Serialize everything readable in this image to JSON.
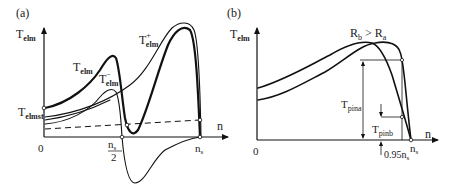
{
  "panel_a": {
    "tag": "(a)",
    "y_axis_label": {
      "main": "T",
      "sub": "elm"
    },
    "x_axis_label": "n",
    "origin_label": "0",
    "start_torque_label": {
      "main": "T",
      "sub": "elmst"
    },
    "half_sync_label": {
      "num_main": "n",
      "num_sub": "s",
      "den": "2"
    },
    "sync_label": {
      "main": "n",
      "sub": "s"
    },
    "curve_labels": {
      "total": {
        "main": "T",
        "sub": "elm"
      },
      "positive": {
        "main": "T",
        "sub": "elm",
        "sup": "+"
      },
      "negative": {
        "main": "T",
        "sub": "elm",
        "sup": "−"
      }
    }
  },
  "panel_b": {
    "tag": "(b)",
    "y_axis_label": {
      "main": "T",
      "sub": "elm"
    },
    "x_axis_label": "n",
    "origin_label": "0",
    "relation_label": {
      "a": "R",
      "a_sub": "b",
      "op": " > ",
      "b": "R",
      "b_sub": "a"
    },
    "pina_label": {
      "main": "T",
      "sub": "pina"
    },
    "pinb_label": {
      "main": "T",
      "sub": "pinb"
    },
    "slip_label": {
      "main": "0.95n",
      "sub": "s"
    },
    "sync_label": {
      "main": "n",
      "sub": "s"
    }
  }
}
